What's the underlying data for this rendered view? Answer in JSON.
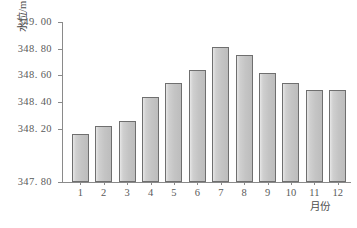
{
  "chart_data": {
    "type": "bar",
    "title": "",
    "xlabel": "月份",
    "ylabel": "水位/m",
    "categories": [
      "1",
      "2",
      "3",
      "4",
      "5",
      "6",
      "7",
      "8",
      "9",
      "10",
      "11",
      "12"
    ],
    "values": [
      348.16,
      348.22,
      348.26,
      348.44,
      348.54,
      348.64,
      348.81,
      348.75,
      348.62,
      348.54,
      348.49,
      348.49
    ],
    "ylim": [
      347.8,
      349.0
    ],
    "ytick_labels": [
      "349. 00",
      "348. 80",
      "348. 60",
      "348. 40",
      "348. 20",
      "347. 80"
    ],
    "ytick_values": [
      349.0,
      348.8,
      348.6,
      348.4,
      348.2,
      347.8
    ],
    "grid": false,
    "legend": null,
    "bar_color": "#c7c7c7",
    "bar_edge_color": "#6f6f6f",
    "axis_color": "#8a8a8a",
    "text_color": "#5a5a5a"
  }
}
